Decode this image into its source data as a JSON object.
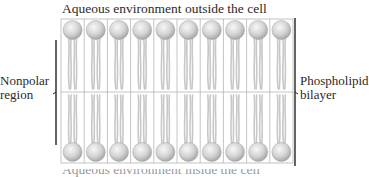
{
  "title_top": "Aqueous environment outside the cell",
  "label_left_line1": "Nonpolar",
  "label_left_line2": "region",
  "label_right_line1": "Phospholipid",
  "label_right_line2": "bilayer",
  "label_bottom": "Aqueous environment inside the cell",
  "structure": {
    "columns": 10,
    "layers": [
      "outer-leaflet",
      "inner-leaflet"
    ],
    "head_color": "#d9d9d9",
    "tail_color": "#c8c8c8",
    "grid_color": "#b5b5b5",
    "bracket_color": "#222222"
  }
}
